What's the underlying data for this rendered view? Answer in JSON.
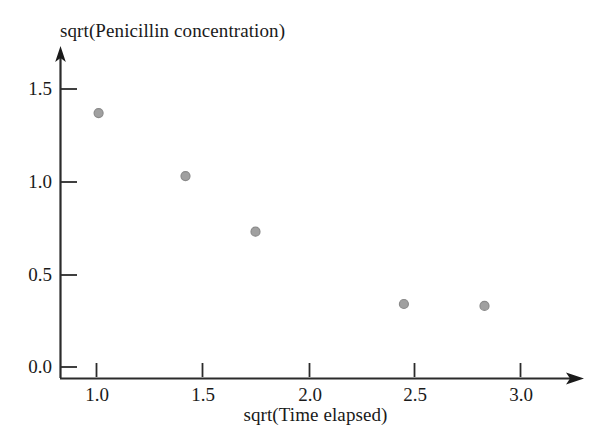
{
  "chart_data": {
    "type": "scatter",
    "title": "",
    "xlabel": "sqrt(Time elapsed)",
    "ylabel": "sqrt(Penicillin concentration)",
    "ylabel_position": "above-axis",
    "x": [
      1.01,
      1.42,
      1.75,
      2.45,
      2.83
    ],
    "values": [
      1.37,
      1.03,
      0.73,
      0.34,
      0.33
    ],
    "points": [
      {
        "x": 1.01,
        "y": 1.37
      },
      {
        "x": 1.42,
        "y": 1.03
      },
      {
        "x": 1.75,
        "y": 0.73
      },
      {
        "x": 2.45,
        "y": 0.34
      },
      {
        "x": 2.83,
        "y": 0.33
      }
    ],
    "xticks": [
      1.0,
      1.5,
      2.0,
      2.5,
      3.0
    ],
    "xtick_labels": [
      "1.0",
      "1.5",
      "2.0",
      "2.5",
      "3.0"
    ],
    "yticks": [
      0.0,
      0.5,
      1.0,
      1.5
    ],
    "ytick_labels": [
      "0.0",
      "0.5",
      "1.0",
      "1.5"
    ],
    "xlim": [
      0.83,
      3.3
    ],
    "ylim": [
      -0.06,
      1.66
    ],
    "grid": false,
    "legend": null,
    "marker": {
      "shape": "circle",
      "fill_color": "#a0a0a0",
      "edge_color": "#8a8a8a",
      "size_px": 9
    },
    "axis_style": {
      "color": "#2b2b2b",
      "arrow_heads": true,
      "tick_direction": "in",
      "spines": [
        "left",
        "bottom"
      ]
    }
  },
  "geometry": {
    "width": 611,
    "height": 441,
    "origin_x": 60,
    "origin_y": 378,
    "px_per_x_unit": 212,
    "px_per_y_unit": 185.3,
    "x_axis_tip": 583,
    "y_axis_tip": 48
  }
}
